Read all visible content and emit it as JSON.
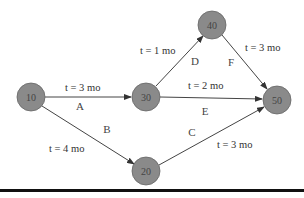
{
  "diagram": {
    "type": "activity-network",
    "nodes": [
      {
        "id": "10",
        "label": "10",
        "x": 31,
        "y": 97
      },
      {
        "id": "30",
        "label": "30",
        "x": 146,
        "y": 97
      },
      {
        "id": "40",
        "label": "40",
        "x": 212,
        "y": 25
      },
      {
        "id": "50",
        "label": "50",
        "x": 277,
        "y": 100
      },
      {
        "id": "20",
        "label": "20",
        "x": 146,
        "y": 171
      }
    ],
    "edges": [
      {
        "activity": "A",
        "from": "10",
        "to": "30",
        "time": "t = 3 mo"
      },
      {
        "activity": "B",
        "from": "10",
        "to": "20",
        "time": "t = 4 mo"
      },
      {
        "activity": "C",
        "from": "20",
        "to": "50",
        "time": "t = 3 mo"
      },
      {
        "activity": "D",
        "from": "30",
        "to": "40",
        "time": "t = 1 mo"
      },
      {
        "activity": "E",
        "from": "30",
        "to": "50",
        "time": "t = 2 mo"
      },
      {
        "activity": "F",
        "from": "40",
        "to": "50",
        "time": "t = 3 mo"
      }
    ],
    "colors": {
      "node_fill": "#8a8a8a",
      "node_stroke": "#555555",
      "edge": "#444444",
      "rule": "#111111"
    }
  }
}
